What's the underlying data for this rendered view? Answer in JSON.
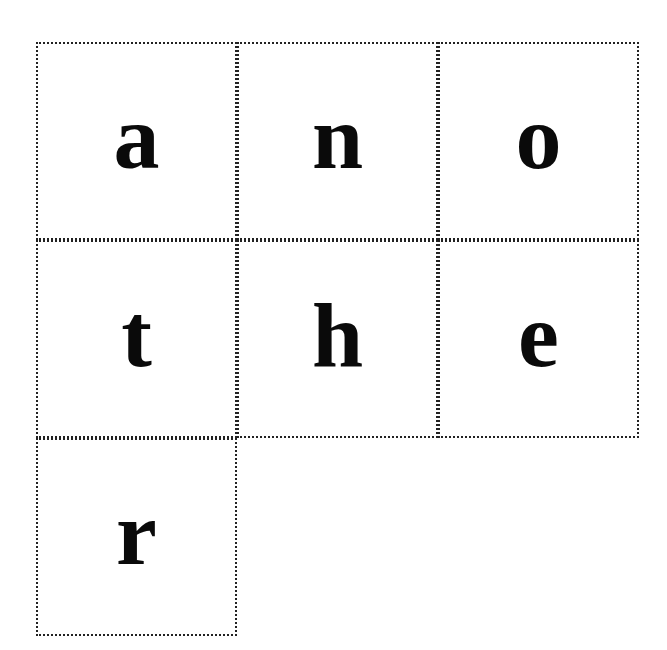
{
  "word": "another",
  "tiles": [
    {
      "letter": "a",
      "row": 0,
      "col": 0
    },
    {
      "letter": "n",
      "row": 0,
      "col": 1
    },
    {
      "letter": "o",
      "row": 0,
      "col": 2
    },
    {
      "letter": "t",
      "row": 1,
      "col": 0
    },
    {
      "letter": "h",
      "row": 1,
      "col": 1
    },
    {
      "letter": "e",
      "row": 1,
      "col": 2
    },
    {
      "letter": "r",
      "row": 2,
      "col": 0
    }
  ]
}
